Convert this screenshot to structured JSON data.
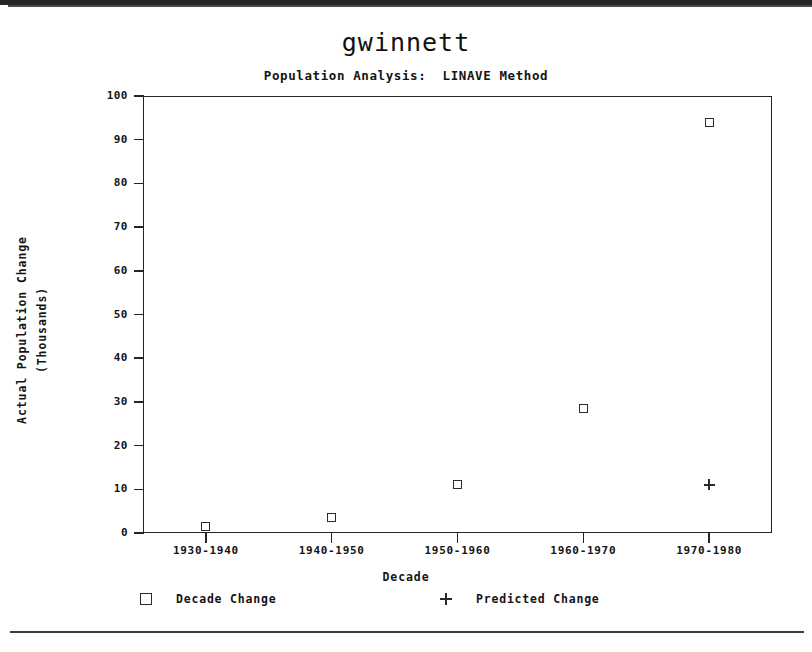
{
  "chart_data": {
    "type": "scatter",
    "title": "gwinnett",
    "subtitle": "Population Analysis:  LINAVE Method",
    "xlabel": "Decade",
    "ylabel": "Actual Population Change\n(Thousands)",
    "ylabel_line1": "Actual Population Change",
    "ylabel_line2": "(Thousands)",
    "categories": [
      "1930-1940",
      "1940-1950",
      "1950-1960",
      "1960-1970",
      "1970-1980"
    ],
    "ylim": [
      0,
      100
    ],
    "yticks": [
      0,
      10,
      20,
      30,
      40,
      50,
      60,
      70,
      80,
      90,
      100
    ],
    "grid": false,
    "legend_position": "bottom",
    "series": [
      {
        "name": "Decade Change",
        "marker": "square",
        "color": "#2b2b2b",
        "values": [
          1.5,
          3.5,
          11,
          28.5,
          94
        ]
      },
      {
        "name": "Predicted Change",
        "marker": "plus",
        "color": "#2b2b2b",
        "values": [
          null,
          null,
          null,
          null,
          11
        ]
      }
    ]
  },
  "legend": {
    "entries": [
      {
        "label": "Decade Change",
        "marker": "square-marker-icon"
      },
      {
        "label": "Predicted Change",
        "marker": "plus-marker-icon"
      }
    ]
  }
}
